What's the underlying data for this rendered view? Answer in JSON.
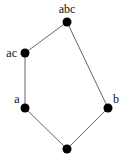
{
  "diagram": {
    "type": "hasse-diagram",
    "nodes": [
      {
        "id": "abc",
        "label": "abc"
      },
      {
        "id": "ac",
        "label": "ac"
      },
      {
        "id": "a",
        "label": "a"
      },
      {
        "id": "b",
        "label": "b"
      },
      {
        "id": "bottom",
        "label": ""
      }
    ],
    "edges": [
      {
        "from": "abc",
        "to": "ac"
      },
      {
        "from": "ac",
        "to": "a"
      },
      {
        "from": "a",
        "to": "bottom"
      },
      {
        "from": "abc",
        "to": "b"
      },
      {
        "from": "b",
        "to": "bottom"
      }
    ]
  }
}
